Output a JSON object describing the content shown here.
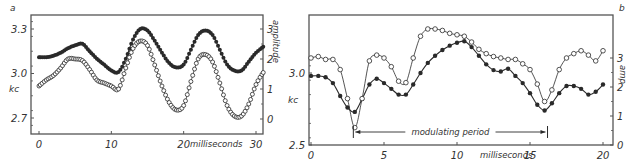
{
  "chart_data": [
    {
      "panel": "a",
      "type": "line",
      "title": "",
      "xlabel": "milliseconds",
      "ylabel": "kc",
      "ylabel_right": "amplitude",
      "xlim": [
        0,
        31
      ],
      "ylim": [
        2.62,
        3.38
      ],
      "ylim_right": [
        -0.35,
        3.5
      ],
      "x_ticks": [
        "0",
        "10",
        "20",
        "30"
      ],
      "y_ticks": [
        "2.7",
        "3.0",
        "3.3"
      ],
      "y_ticks_right": [
        "0",
        "1",
        "2",
        "3"
      ],
      "grid": false,
      "legend": null,
      "series": [
        {
          "name": "frequency (kc)",
          "marker": "filled-circle",
          "axis": "left",
          "x": [
            0,
            1,
            2,
            3,
            4,
            5,
            6,
            7,
            8,
            9,
            10,
            11,
            12,
            13,
            14,
            15,
            16,
            17,
            18,
            19,
            20,
            21,
            22,
            23,
            24,
            25,
            26,
            27,
            28,
            29,
            30,
            31
          ],
          "values": [
            3.11,
            3.11,
            3.12,
            3.14,
            3.17,
            3.19,
            3.2,
            3.15,
            3.1,
            3.06,
            3.02,
            3.01,
            3.1,
            3.23,
            3.3,
            3.29,
            3.22,
            3.14,
            3.07,
            3.04,
            3.06,
            3.16,
            3.26,
            3.29,
            3.26,
            3.16,
            3.06,
            3.02,
            3.02,
            3.08,
            3.14,
            3.18
          ]
        },
        {
          "name": "amplitude",
          "marker": "open-circle",
          "axis": "right",
          "x": [
            0,
            1,
            2,
            3,
            4,
            5,
            6,
            7,
            8,
            9,
            10,
            11,
            12,
            13,
            14,
            15,
            16,
            17,
            18,
            19,
            20,
            21,
            22,
            23,
            24,
            25,
            26,
            27,
            28,
            29,
            30,
            31
          ],
          "values": [
            1.1,
            1.3,
            1.45,
            1.7,
            2.0,
            2.0,
            1.95,
            1.65,
            1.3,
            1.2,
            1.1,
            1.0,
            1.7,
            2.35,
            2.6,
            2.45,
            1.8,
            1.1,
            0.55,
            0.3,
            0.45,
            1.25,
            2.0,
            2.15,
            1.9,
            1.2,
            0.45,
            0.1,
            0.1,
            0.5,
            1.15,
            1.55
          ]
        }
      ]
    },
    {
      "panel": "b",
      "type": "line",
      "title": "",
      "xlabel": "milliseconds",
      "ylabel": "kc",
      "ylabel_right": "amp",
      "xlim": [
        -0.1,
        20.3
      ],
      "ylim": [
        2.5,
        3.4
      ],
      "ylim_right": [
        0,
        4.4
      ],
      "x_ticks": [
        "0",
        "5",
        "10",
        "15",
        "20"
      ],
      "y_ticks": [
        "2.5",
        "3.0"
      ],
      "y_ticks_right": [
        "0",
        "1",
        "2",
        "3"
      ],
      "grid": false,
      "legend": null,
      "annotations": [
        {
          "text": "modulating period",
          "x_start": 2.9,
          "x_end": 16.2
        }
      ],
      "series": [
        {
          "name": "frequency (kc)",
          "marker": "filled-circle",
          "axis": "left",
          "x": [
            0,
            0.5,
            1,
            1.5,
            2,
            2.5,
            3,
            3.5,
            4,
            4.5,
            5,
            5.5,
            6,
            6.5,
            7,
            7.5,
            8,
            8.5,
            9,
            9.5,
            10,
            10.5,
            11,
            11.5,
            12,
            12.5,
            13,
            13.5,
            14,
            14.5,
            15,
            15.5,
            16,
            16.5,
            17,
            17.5,
            18,
            18.5,
            19,
            19.5,
            20
          ],
          "values": [
            2.98,
            2.98,
            2.97,
            2.93,
            2.84,
            2.76,
            2.73,
            2.82,
            2.92,
            2.96,
            2.93,
            2.89,
            2.85,
            2.85,
            2.92,
            3.0,
            3.07,
            3.12,
            3.16,
            3.19,
            3.21,
            3.22,
            3.18,
            3.12,
            3.06,
            3.02,
            3.01,
            3.03,
            2.98,
            2.93,
            2.86,
            2.78,
            2.74,
            2.79,
            2.86,
            2.91,
            2.91,
            2.89,
            2.85,
            2.87,
            2.92
          ]
        },
        {
          "name": "amplitude",
          "marker": "open-circle",
          "axis": "right",
          "x": [
            0,
            0.5,
            1,
            1.5,
            2,
            2.5,
            3,
            3.5,
            4,
            4.5,
            5,
            5.5,
            6,
            6.5,
            7,
            7.5,
            8,
            8.5,
            9,
            9.5,
            10,
            10.5,
            11,
            11.5,
            12,
            12.5,
            13,
            13.5,
            14,
            14.5,
            15,
            15.5,
            16,
            16.5,
            17,
            17.5,
            18,
            18.5,
            19,
            19.5,
            20
          ],
          "values": [
            3.0,
            3.05,
            2.95,
            2.95,
            2.6,
            1.6,
            0.6,
            1.6,
            2.9,
            3.1,
            3.0,
            2.7,
            2.2,
            2.15,
            3.0,
            3.75,
            4.0,
            4.0,
            3.95,
            3.85,
            3.8,
            3.75,
            3.55,
            3.3,
            3.15,
            3.05,
            3.0,
            2.95,
            2.95,
            2.8,
            2.6,
            2.1,
            1.5,
            1.9,
            2.6,
            3.0,
            3.15,
            3.25,
            3.1,
            2.9,
            3.25
          ]
        }
      ]
    }
  ],
  "panels": {
    "a": {
      "letter": "a",
      "y_left_label": "kc",
      "y_right_label": "amplitude",
      "x_label": "milliseconds",
      "y_left_ticks": [
        {
          "label": "3.3",
          "v": 3.3
        },
        {
          "label": "3.0",
          "v": 3.0
        },
        {
          "label": "2.7",
          "v": 2.7
        }
      ],
      "y_right_ticks": [
        {
          "label": "3",
          "v": 3
        },
        {
          "label": "2",
          "v": 2
        },
        {
          "label": "1",
          "v": 1
        },
        {
          "label": "0",
          "v": 0
        }
      ],
      "x_ticks": [
        {
          "label": "0",
          "v": 0
        },
        {
          "label": "10",
          "v": 10
        },
        {
          "label": "20",
          "v": 20
        },
        {
          "label": "30",
          "v": 30
        }
      ]
    },
    "b": {
      "letter": "b",
      "y_left_label": "kc",
      "y_right_label": "amp",
      "x_label": "milliseconds",
      "annotation": "modulating period",
      "y_left_ticks": [
        {
          "label": "3.0",
          "v": 3.0
        },
        {
          "label": "2.5",
          "v": 2.5
        }
      ],
      "y_right_ticks": [
        {
          "label": "3",
          "v": 3
        },
        {
          "label": "2",
          "v": 2
        },
        {
          "label": "1",
          "v": 1
        },
        {
          "label": "0",
          "v": 0
        }
      ],
      "x_ticks": [
        {
          "label": "0",
          "v": 0
        },
        {
          "label": "5",
          "v": 5
        },
        {
          "label": "10",
          "v": 10
        },
        {
          "label": "15",
          "v": 15
        },
        {
          "label": "20",
          "v": 20
        }
      ]
    }
  },
  "colors": {
    "ink": "#2a2a2a",
    "frame": "#555555",
    "background": "#ffffff"
  }
}
